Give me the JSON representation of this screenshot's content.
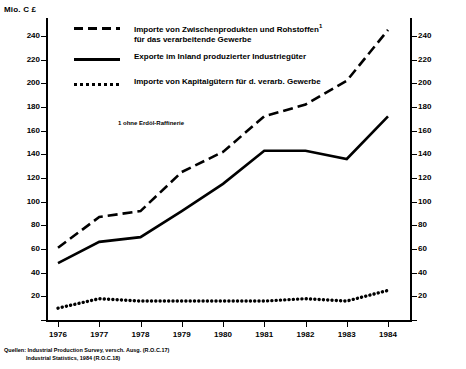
{
  "axis": {
    "unit_caption": "Mio. C £",
    "y_ticks": [
      0,
      20,
      40,
      60,
      80,
      100,
      120,
      140,
      160,
      180,
      200,
      220,
      240
    ],
    "y_min": 0,
    "y_max": 250,
    "x_labels": [
      "1976",
      "1977",
      "1978",
      "1979",
      "1980",
      "1981",
      "1982",
      "1983",
      "1984"
    ]
  },
  "legend": {
    "items": [
      {
        "key": "imports-intermediate",
        "style": "dashed",
        "line1": "Importe von Zwischenprodukten und Rohstoffen",
        "sup": "1",
        "line2": "für das verarbeitende Gewerbe"
      },
      {
        "key": "exports-domestic",
        "style": "solid",
        "line1": "Exporte im Inland  produzierter Industriegüter",
        "sup": "",
        "line2": ""
      },
      {
        "key": "imports-capital",
        "style": "dotted",
        "line1": "Importe von Kapitalgütern für d. verarb. Gewerbe",
        "sup": "",
        "line2": ""
      }
    ],
    "footnote": "1 ohne Erdöl-Raffinerie"
  },
  "source": {
    "line1": "Quellen: Industrial Production Survey, versch. Ausg. (R.O.C.17)",
    "line2": "Industrial  Statistics, 1984  (R.O.C.18)"
  },
  "chart_data": {
    "type": "line",
    "title": "",
    "xlabel": "",
    "ylabel": "Mio. C £",
    "ylim": [
      0,
      250
    ],
    "grid": false,
    "legend_position": "top-left",
    "x": [
      "1976",
      "1977",
      "1978",
      "1979",
      "1980",
      "1981",
      "1982",
      "1983",
      "1984"
    ],
    "series": [
      {
        "name": "Importe von Zwischenprodukten und Rohstoffen für das verarbeitende Gewerbe",
        "style": "dashed",
        "values": [
          61,
          87,
          92,
          125,
          142,
          172,
          182,
          202,
          245
        ]
      },
      {
        "name": "Exporte im Inland produzierter Industriegüter",
        "style": "solid",
        "values": [
          48,
          66,
          70,
          92,
          115,
          143,
          143,
          136,
          172
        ]
      },
      {
        "name": "Importe von Kapitalgütern für d. verarb. Gewerbe",
        "style": "dotted",
        "values": [
          10,
          18,
          16,
          16,
          16,
          16,
          18,
          16,
          25
        ]
      }
    ]
  }
}
